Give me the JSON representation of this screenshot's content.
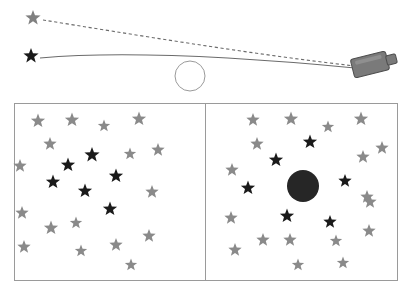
{
  "figure": {
    "background_color": "#ffffff"
  },
  "colors": {
    "apparent_star": "#808080",
    "true_star": "#1a1a1a",
    "gray_star": "#8a8a8a",
    "black_star": "#1a1a1a",
    "line_stroke": "#6b6b6b",
    "panel_border": "#9a9a9a",
    "lens_circle_stroke": "#9a9a9a",
    "black_hole_fill": "#262626",
    "camera_body": "#7a7a7a",
    "camera_outline": "#4d4d4d"
  },
  "top_diagram": {
    "name": "light-bending-diagram",
    "apparent_star": {
      "label": "apparent-star-position",
      "x": 33,
      "y": 18,
      "size": 16,
      "color": "#808080"
    },
    "true_star": {
      "label": "true-star-position",
      "x": 31,
      "y": 56,
      "size": 16,
      "color": "#1a1a1a"
    },
    "lens_circle": {
      "label": "lensing-mass",
      "cx": 190,
      "cy": 76,
      "r": 15,
      "stroke": "#9a9a9a"
    },
    "camera": {
      "label": "observer-telescope",
      "x": 352,
      "y": 55,
      "width": 36,
      "height": 19,
      "rotation": -14
    },
    "dashed_ray": {
      "label": "apparent-light-path",
      "style": "dashed",
      "path": "M 43 20 C 130 34, 250 54, 355 66"
    },
    "solid_ray": {
      "label": "actual-light-path",
      "style": "solid",
      "path": "M 40 58 C 130 50, 250 58, 355 68"
    }
  },
  "panels": {
    "name": "star-field-panels",
    "frame": {
      "x": 14,
      "y": 103,
      "width": 383,
      "height": 177,
      "divider_x": 205
    },
    "left_panel": {
      "name": "undeflected-star-field",
      "caption": "",
      "stars": [
        {
          "x": 38,
          "y": 121,
          "size": 15,
          "tone": "gray"
        },
        {
          "x": 72,
          "y": 120,
          "size": 15,
          "tone": "gray"
        },
        {
          "x": 104,
          "y": 126,
          "size": 13,
          "tone": "gray"
        },
        {
          "x": 139,
          "y": 119,
          "size": 15,
          "tone": "gray"
        },
        {
          "x": 50,
          "y": 144,
          "size": 14,
          "tone": "gray"
        },
        {
          "x": 130,
          "y": 154,
          "size": 13,
          "tone": "gray"
        },
        {
          "x": 158,
          "y": 150,
          "size": 14,
          "tone": "gray"
        },
        {
          "x": 20,
          "y": 166,
          "size": 14,
          "tone": "gray"
        },
        {
          "x": 152,
          "y": 192,
          "size": 14,
          "tone": "gray"
        },
        {
          "x": 22,
          "y": 213,
          "size": 14,
          "tone": "gray"
        },
        {
          "x": 51,
          "y": 228,
          "size": 15,
          "tone": "gray"
        },
        {
          "x": 76,
          "y": 223,
          "size": 13,
          "tone": "gray"
        },
        {
          "x": 24,
          "y": 247,
          "size": 14,
          "tone": "gray"
        },
        {
          "x": 81,
          "y": 251,
          "size": 13,
          "tone": "gray"
        },
        {
          "x": 116,
          "y": 245,
          "size": 14,
          "tone": "gray"
        },
        {
          "x": 149,
          "y": 236,
          "size": 14,
          "tone": "gray"
        },
        {
          "x": 131,
          "y": 265,
          "size": 13,
          "tone": "gray"
        },
        {
          "x": 68,
          "y": 165,
          "size": 15,
          "tone": "black"
        },
        {
          "x": 92,
          "y": 155,
          "size": 16,
          "tone": "black"
        },
        {
          "x": 53,
          "y": 182,
          "size": 15,
          "tone": "black"
        },
        {
          "x": 85,
          "y": 191,
          "size": 15,
          "tone": "black"
        },
        {
          "x": 116,
          "y": 176,
          "size": 15,
          "tone": "black"
        },
        {
          "x": 110,
          "y": 209,
          "size": 15,
          "tone": "black"
        }
      ]
    },
    "right_panel": {
      "name": "lensed-star-field",
      "caption": "",
      "black_hole": {
        "label": "occulting-black-hole",
        "cx": 303,
        "cy": 186,
        "r": 16,
        "fill": "#262626"
      },
      "stars": [
        {
          "x": 253,
          "y": 120,
          "size": 14,
          "tone": "gray"
        },
        {
          "x": 291,
          "y": 119,
          "size": 15,
          "tone": "gray"
        },
        {
          "x": 328,
          "y": 127,
          "size": 13,
          "tone": "gray"
        },
        {
          "x": 361,
          "y": 119,
          "size": 15,
          "tone": "gray"
        },
        {
          "x": 257,
          "y": 144,
          "size": 14,
          "tone": "gray"
        },
        {
          "x": 363,
          "y": 157,
          "size": 14,
          "tone": "gray"
        },
        {
          "x": 382,
          "y": 148,
          "size": 14,
          "tone": "gray"
        },
        {
          "x": 232,
          "y": 170,
          "size": 14,
          "tone": "gray"
        },
        {
          "x": 367,
          "y": 197,
          "size": 14,
          "tone": "gray"
        },
        {
          "x": 231,
          "y": 218,
          "size": 14,
          "tone": "gray"
        },
        {
          "x": 235,
          "y": 250,
          "size": 14,
          "tone": "gray"
        },
        {
          "x": 263,
          "y": 240,
          "size": 14,
          "tone": "gray"
        },
        {
          "x": 290,
          "y": 240,
          "size": 14,
          "tone": "gray"
        },
        {
          "x": 298,
          "y": 265,
          "size": 13,
          "tone": "gray"
        },
        {
          "x": 336,
          "y": 241,
          "size": 13,
          "tone": "gray"
        },
        {
          "x": 343,
          "y": 263,
          "size": 13,
          "tone": "gray"
        },
        {
          "x": 369,
          "y": 231,
          "size": 14,
          "tone": "gray"
        },
        {
          "x": 370,
          "y": 202,
          "size": 14,
          "tone": "gray"
        },
        {
          "x": 310,
          "y": 142,
          "size": 15,
          "tone": "black"
        },
        {
          "x": 276,
          "y": 160,
          "size": 15,
          "tone": "black"
        },
        {
          "x": 248,
          "y": 188,
          "size": 15,
          "tone": "black"
        },
        {
          "x": 345,
          "y": 181,
          "size": 14,
          "tone": "black"
        },
        {
          "x": 287,
          "y": 216,
          "size": 15,
          "tone": "black"
        },
        {
          "x": 330,
          "y": 222,
          "size": 14,
          "tone": "black"
        }
      ]
    }
  }
}
